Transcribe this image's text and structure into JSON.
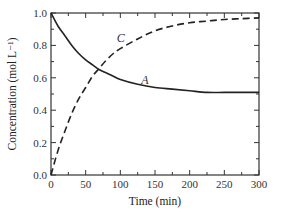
{
  "chart_data": {
    "type": "line",
    "title": "",
    "xlabel": "Time (min)",
    "ylabel": "Concentration (mol L⁻¹)",
    "xlim": [
      0,
      300
    ],
    "ylim": [
      0.0,
      1.0
    ],
    "xticks": [
      0,
      50,
      100,
      150,
      200,
      250,
      300
    ],
    "xtick_labels": [
      "0",
      "50",
      "100",
      "150",
      "200",
      "250",
      "300"
    ],
    "yticks": [
      0.0,
      0.2,
      0.4,
      0.6,
      0.8,
      1.0
    ],
    "ytick_labels": [
      "0.0",
      "0.2",
      "0.4",
      "0.6",
      "0.8",
      "1.0"
    ],
    "grid": false,
    "legend": "none (curves labeled inline)",
    "x": [
      0,
      10,
      20,
      30,
      40,
      50,
      60,
      70,
      80,
      90,
      100,
      125,
      150,
      175,
      200,
      225,
      250,
      275,
      300
    ],
    "series": [
      {
        "name": "A",
        "style": "solid",
        "values": [
          1.0,
          0.92,
          0.86,
          0.8,
          0.75,
          0.71,
          0.68,
          0.65,
          0.63,
          0.61,
          0.59,
          0.56,
          0.54,
          0.53,
          0.52,
          0.51,
          0.51,
          0.51,
          0.51
        ]
      },
      {
        "name": "C",
        "style": "dashed",
        "values": [
          0.0,
          0.15,
          0.27,
          0.38,
          0.47,
          0.54,
          0.61,
          0.66,
          0.71,
          0.75,
          0.78,
          0.84,
          0.89,
          0.92,
          0.94,
          0.95,
          0.96,
          0.965,
          0.97
        ]
      }
    ],
    "annotations": [
      {
        "text": "C",
        "x": 95,
        "y": 0.82
      },
      {
        "text": "A",
        "x": 130,
        "y": 0.56
      }
    ]
  }
}
